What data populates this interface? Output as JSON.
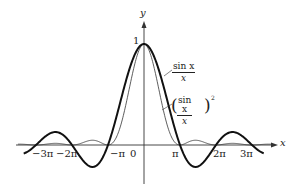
{
  "chart_data": {
    "type": "line",
    "title": "",
    "xlabel": "x",
    "ylabel": "y",
    "x_tick_labels": [
      "−3π",
      "−2π",
      "−π",
      "0",
      "π",
      "2π",
      "3π"
    ],
    "x_ticks": [
      -9.42,
      -6.28,
      -3.14,
      0,
      3.14,
      6.28,
      9.42
    ],
    "y_tick_labels": [
      "1"
    ],
    "xlim": [
      -10.6,
      11.5
    ],
    "ylim": [
      -0.3,
      1.15
    ],
    "grid": false,
    "legend": "inline annotations",
    "series": [
      {
        "name": "sin x / x",
        "style": "thick",
        "function": "sin(x)/x",
        "x": [
          -10.5,
          -9.42,
          -7.73,
          -6.28,
          -4.49,
          -3.14,
          -1.57,
          0,
          1.57,
          3.14,
          4.49,
          6.28,
          7.73,
          9.42,
          10.5
        ],
        "y": [
          -0.08,
          0,
          0.128,
          0,
          -0.217,
          0,
          0.637,
          1,
          0.637,
          0,
          -0.217,
          0,
          0.128,
          0,
          -0.08
        ]
      },
      {
        "name": "(sin x / x)^2",
        "style": "thin",
        "function": "(sin(x)/x)^2",
        "x": [
          -10.5,
          -9.42,
          -7.73,
          -6.28,
          -4.49,
          -3.14,
          -1.57,
          0,
          1.57,
          3.14,
          4.49,
          6.28,
          7.73,
          9.42,
          10.5
        ],
        "y": [
          0.006,
          0,
          0.016,
          0,
          0.047,
          0,
          0.405,
          1,
          0.405,
          0,
          0.047,
          0,
          0.016,
          0,
          0.006
        ]
      }
    ]
  },
  "labels": {
    "y_axis": "y",
    "x_axis": "x",
    "one": "1",
    "origin": "0",
    "neg3pi": "−3π",
    "neg2pi": "−2π",
    "negpi": "−π",
    "pi": "π",
    "twopi": "2π",
    "threepi": "3π",
    "sinc_num": "sin x",
    "sinc_den": "x",
    "sinc2_num": "sin x",
    "sinc2_den": "x",
    "paren_left": "(",
    "paren_right": ")",
    "exp": "2"
  },
  "colors": {
    "ink": "#222222",
    "background": "#ffffff"
  }
}
